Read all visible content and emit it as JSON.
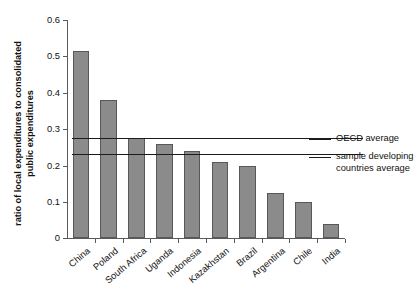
{
  "chart_data": {
    "type": "bar",
    "title": "",
    "subtitle": "",
    "xlabel": "",
    "ylabel": "ratio of local expenditures to consolidated public expenditures",
    "ylabel_lines": [
      "ratio of local expenditures to consolidated",
      "public expenditures"
    ],
    "categories": [
      "China",
      "Poland",
      "South Africa",
      "Uganda",
      "Indonesia",
      "Kazakhstan",
      "Brazil",
      "Argentina",
      "Chile",
      "India"
    ],
    "values": [
      0.515,
      0.38,
      0.275,
      0.26,
      0.24,
      0.21,
      0.198,
      0.125,
      0.098,
      0.038
    ],
    "ylim": [
      0,
      0.6
    ],
    "ytick_values": [
      0,
      0.1,
      0.2,
      0.3,
      0.4,
      0.5,
      0.6
    ],
    "ytick_labels": [
      "0",
      "0.1",
      "0.2",
      "0.3",
      "0.4",
      "0.5",
      "0.6"
    ],
    "grid": false,
    "legend_position": "right",
    "bar_color": "#8b8b8b",
    "bar_border_color": "#585858",
    "reference_lines": [
      {
        "name": "OECD average",
        "value": 0.275,
        "color": "#1b1b1b"
      },
      {
        "name": "sample developing countries average",
        "value": 0.23,
        "color": "#1b1b1b"
      }
    ]
  },
  "legend": {
    "items": [
      {
        "label_lines": [
          "OECD average"
        ]
      },
      {
        "label_lines": [
          "sample developing",
          "countries average"
        ]
      }
    ]
  }
}
